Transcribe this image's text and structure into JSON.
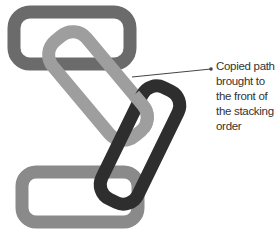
{
  "figure": {
    "callout_lines": [
      "Copied path",
      "brought to",
      "the front of",
      "the stacking",
      "order"
    ]
  },
  "colors": {
    "link_top": "#6b6b6b",
    "link_light": "#9e9e9e",
    "link_dark": "#2e2e2e",
    "link_bottom": "#8a8a8a",
    "leader": "#444444"
  }
}
